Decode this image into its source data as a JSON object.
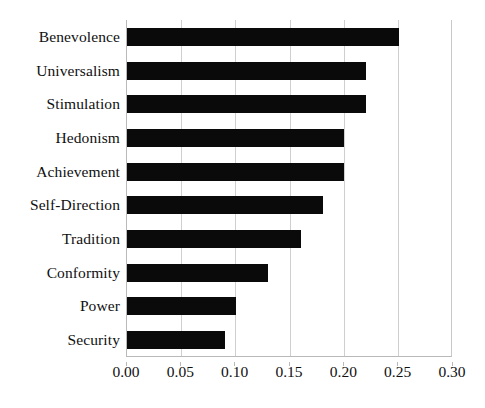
{
  "chart_data": {
    "type": "bar",
    "orientation": "horizontal",
    "title": "",
    "subtitle": "",
    "xlabel": "",
    "ylabel": "",
    "categories": [
      "Benevolence",
      "Universalism",
      "Stimulation",
      "Hedonism",
      "Achievement",
      "Self-Direction",
      "Tradition",
      "Conformity",
      "Power",
      "Security"
    ],
    "values": [
      0.25,
      0.22,
      0.22,
      0.2,
      0.2,
      0.18,
      0.16,
      0.13,
      0.1,
      0.09
    ],
    "xlim": [
      0.0,
      0.3
    ],
    "xticks": [
      0.0,
      0.05,
      0.1,
      0.15,
      0.2,
      0.25,
      0.3
    ],
    "xticklabels": [
      "0.00",
      "0.05",
      "0.10",
      "0.15",
      "0.20",
      "0.25",
      "0.30"
    ],
    "grid": "vertical",
    "legend": null,
    "bar_color": "#0a0a0a",
    "gridline_color": "#cfcfcf",
    "axis_color": "#b9b9b9",
    "background_color": "#ffffff"
  }
}
